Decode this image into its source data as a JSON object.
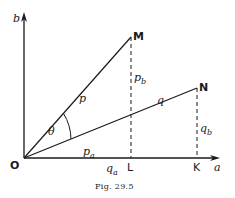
{
  "figure": {
    "caption": "Fig. 29.5",
    "axes": {
      "x_label": "a",
      "y_label": "b",
      "origin_label": "O"
    },
    "points": {
      "M": "M",
      "N": "N",
      "L": "L",
      "K": "K"
    },
    "vectors": {
      "p": "p",
      "q": "q"
    },
    "components": {
      "p_a": {
        "base": "p",
        "sub": "a"
      },
      "p_b": {
        "base": "p",
        "sub": "b"
      },
      "q_a": {
        "base": "q",
        "sub": "a"
      },
      "q_b": {
        "base": "q",
        "sub": "b"
      }
    },
    "angle_label": "θ",
    "colors": {
      "ink": "#1a1a1a",
      "background": "#ffffff"
    }
  }
}
